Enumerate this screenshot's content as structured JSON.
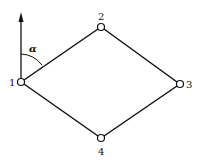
{
  "diagram": {
    "type": "traverse-quadrilateral",
    "angle_label": "α",
    "north_arrow": {
      "from_node": "1",
      "direction": "up"
    },
    "nodes": [
      {
        "id": "1",
        "label": "1"
      },
      {
        "id": "2",
        "label": "2"
      },
      {
        "id": "3",
        "label": "3"
      },
      {
        "id": "4",
        "label": "4"
      }
    ],
    "edges": [
      [
        "1",
        "2"
      ],
      [
        "2",
        "3"
      ],
      [
        "3",
        "4"
      ],
      [
        "4",
        "1"
      ]
    ],
    "colors": {
      "line": "#111111",
      "background": "#ffffff"
    }
  }
}
